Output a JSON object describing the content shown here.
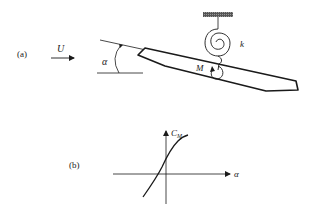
{
  "figure": {
    "panel_a": {
      "label": "(a)",
      "flow_label": "U",
      "angle_label": "α",
      "moment_label": "M",
      "spring_label": "k"
    },
    "panel_b": {
      "label": "(b)",
      "y_axis_label": "C",
      "y_axis_subscript": "M",
      "x_axis_label": "α"
    },
    "colors": {
      "ink": "#1a1a1a",
      "background": "#ffffff"
    }
  }
}
